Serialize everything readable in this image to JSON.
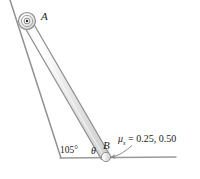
{
  "figure": {
    "background_color": "#ffffff",
    "stroke_color": "#808080",
    "bar_fill_color": "#e2e2e2",
    "text_color": "#1a1a1a"
  },
  "labels": {
    "point_a": "A",
    "point_b": "B",
    "angle_wall": "105°",
    "angle_theta": "θ",
    "friction_symbol": "μ",
    "friction_subscript": "s",
    "friction_equals": " = 0.25, 0.50"
  },
  "geometry": {
    "pin_a": {
      "x": 27,
      "y": 21,
      "outer_r": 8.5,
      "mid_r": 5.5,
      "inner_r": 2.8,
      "dot_r": 1.3
    },
    "contact_b": {
      "x": 106,
      "y": 157
    },
    "incline_wall": {
      "x1": 10,
      "y1": 0,
      "x2": 61,
      "y2": 158
    },
    "ground": {
      "x1": 60,
      "y1": 158,
      "x2": 176,
      "y2": 157
    },
    "bar": {
      "x1": 27,
      "y1": 21,
      "x2": 106,
      "y2": 157,
      "half_width": 4.2
    },
    "leader_arrow": {
      "from_x": 130,
      "from_y": 146,
      "to_x": 109,
      "to_y": 157
    }
  },
  "icons": {
    "pin_joint": "pin-joint-icon",
    "leader_arrow": "leader-arrow-icon"
  }
}
